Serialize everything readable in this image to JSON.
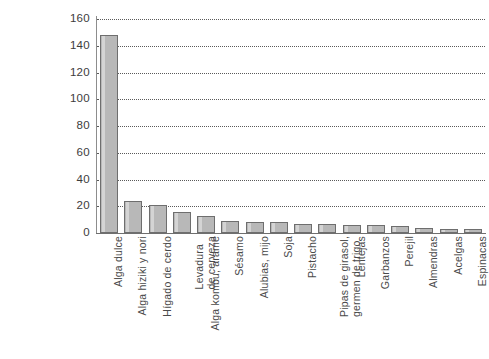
{
  "chart_data": {
    "type": "bar",
    "title": "",
    "subtitle": "",
    "xlabel": "",
    "ylabel": "",
    "ylim": [
      0,
      160
    ],
    "ytick_step": 20,
    "yticks": [
      0,
      20,
      40,
      60,
      80,
      100,
      120,
      140,
      160
    ],
    "ytick_labels": [
      "0",
      "20",
      "40",
      "60",
      "80",
      "100",
      "120",
      "140",
      "160"
    ],
    "grid": true,
    "grid_style": "dotted",
    "grid_axis": "y",
    "legend": false,
    "legend_position": "none",
    "orientation": "vertical",
    "categories": [
      "Alga dulce",
      "Alga hiziki y nori",
      "Hígado de cerdo",
      "Levadura de cerveza",
      "Alga kombu, arame",
      "Sésamo",
      "Alubias, mijo",
      "Soja",
      "Pistacho",
      "Pipas de girasol, germen de trigo",
      "Lentejas",
      "Garbanzos",
      "Perejil",
      "Almendras",
      "Acelgas",
      "Espinacas"
    ],
    "category_lines": [
      [
        "Alga dulce"
      ],
      [
        "Alga hiziki y nori"
      ],
      [
        "Hígado de cerdo"
      ],
      [
        "Levadura",
        "de cerveza"
      ],
      [
        "Alga kombu, arame"
      ],
      [
        "Sésamo"
      ],
      [
        "Alubias, mijo"
      ],
      [
        "Soja"
      ],
      [
        "Pistacho"
      ],
      [
        "Pipas de girasol,",
        "germen de trigo"
      ],
      [
        "Lentejas"
      ],
      [
        "Garbanzos"
      ],
      [
        "Perejil"
      ],
      [
        "Almendras"
      ],
      [
        "Acelgas"
      ],
      [
        "Espinacas"
      ]
    ],
    "values": [
      148,
      24,
      21,
      16,
      13,
      9,
      8,
      8,
      7,
      7,
      6,
      6,
      5,
      4,
      3,
      3
    ],
    "series": [
      {
        "name": "",
        "values": [
          148,
          24,
          21,
          16,
          13,
          9,
          8,
          8,
          7,
          7,
          6,
          6,
          5,
          4,
          3,
          3
        ]
      }
    ]
  },
  "style": {
    "bar_fill": "#b8b8b8",
    "bar_stroke": "#6e6e6e",
    "bar_highlight": "#d4d4d4",
    "grid_color": "#5a5a5a",
    "axis_color": "#6f6f6f",
    "text_color": "#4a4a4a",
    "background": "#ffffff"
  }
}
